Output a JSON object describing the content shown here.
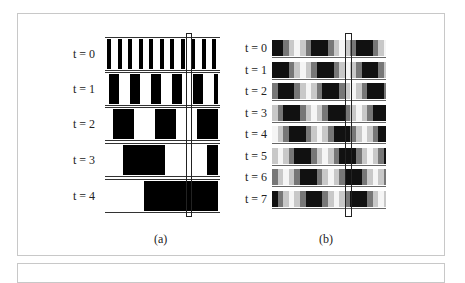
{
  "figure": {
    "panel_a": {
      "caption": "(a)",
      "rows": [
        {
          "label": "t = 0",
          "offset": 0,
          "period": 10.5,
          "black": 4
        },
        {
          "label": "t = 1",
          "offset": 2,
          "period": 21,
          "black": 10
        },
        {
          "label": "t = 2",
          "offset": 6,
          "period": 42,
          "black": 21
        },
        {
          "label": "t = 3",
          "offset": 16,
          "period": 84,
          "black": 42
        },
        {
          "label": "t = 4",
          "offset": 37,
          "period": 168,
          "black": 84
        }
      ]
    },
    "panel_b": {
      "caption": "(b)",
      "rows": [
        {
          "label": "t = 0",
          "shift": 0
        },
        {
          "label": "t = 1",
          "shift": 1
        },
        {
          "label": "t = 2",
          "shift": 2
        },
        {
          "label": "t = 3",
          "shift": 3
        },
        {
          "label": "t = 4",
          "shift": 4
        },
        {
          "label": "t = 5",
          "shift": 5
        },
        {
          "label": "t = 6",
          "shift": 6
        },
        {
          "label": "t = 7",
          "shift": 7
        }
      ],
      "pattern_colors": [
        "#111111",
        "#111111",
        "#777777",
        "#c8c8c8",
        "#f5f5f5",
        "#c8c8c8",
        "#777777",
        "#111111"
      ]
    }
  }
}
